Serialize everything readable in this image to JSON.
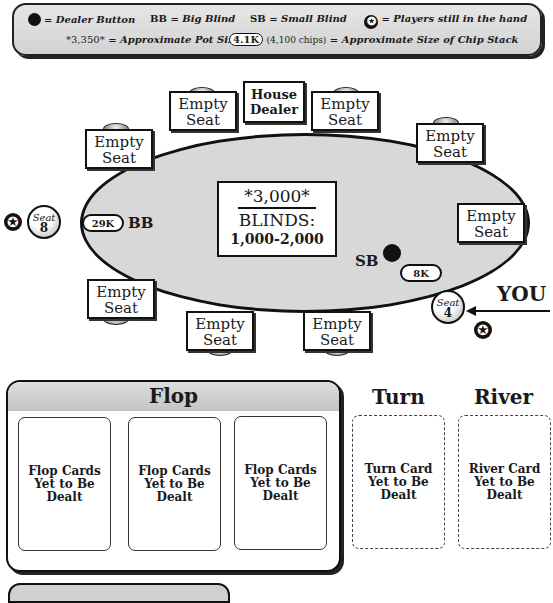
{
  "legend": {
    "dealer_button": "= Dealer Button",
    "bb_abbr": "BB",
    "bb_text": "= Big Blind",
    "sb_abbr": "SB",
    "sb_text": "= Small Blind",
    "star_text": "= Players still in the hand",
    "star_glyph": "✪",
    "pot_example": "*3,350*",
    "pot_text": "= Approximate Pot Size",
    "chip_example": "4.1K",
    "chip_example_detail": "(4,100 chips)",
    "chip_text": "= Approximate Size of Chip Stack"
  },
  "table": {
    "dealer": "House Dealer",
    "empty_seat_line1": "Empty",
    "empty_seat_line2": "Seat",
    "pot": "*3,000*",
    "blinds_label": "BLINDS:",
    "blinds_value": "1,000-2,000",
    "players": [
      {
        "seat_label": "Seat",
        "seat_number": "8",
        "chips": "29K",
        "blind": "BB",
        "in_hand": true
      },
      {
        "seat_label": "Seat",
        "seat_number": "4",
        "chips": "8K",
        "blind": "SB",
        "in_hand": true,
        "is_you": true,
        "dealer_button": true
      }
    ],
    "you_label": "YOU",
    "star_glyph": "✪"
  },
  "board": {
    "flop_title": "Flop",
    "flop_cards": [
      "Flop Cards Yet to Be Dealt",
      "Flop Cards Yet to Be Dealt",
      "Flop Cards Yet to Be Dealt"
    ],
    "turn_title": "Turn",
    "turn_card": "Turn Card Yet to Be Dealt",
    "river_title": "River",
    "river_card": "River Card Yet to Be Dealt"
  }
}
